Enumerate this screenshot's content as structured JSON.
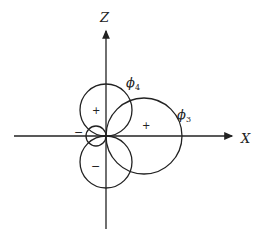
{
  "axes": {
    "x_label": "X",
    "z_label": "Z"
  },
  "orbitals": [
    {
      "name": "phi4",
      "label": "ϕ",
      "subscript": "4",
      "lobes": [
        {
          "sign": "+"
        },
        {
          "sign": "−"
        }
      ]
    },
    {
      "name": "phi3",
      "label": "ϕ",
      "subscript": "3",
      "lobes": [
        {
          "sign": "+"
        },
        {
          "sign": "−"
        }
      ]
    }
  ],
  "signs": {
    "top_lobe": "+",
    "bottom_lobe": "−",
    "right_lobe": "+",
    "left_small_lobe": "−"
  },
  "colors": {
    "stroke": "#222222",
    "background": "#ffffff"
  }
}
